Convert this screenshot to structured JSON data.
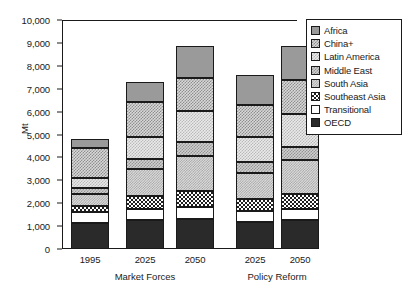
{
  "chart_data": {
    "type": "bar",
    "title": "",
    "subtitle": "",
    "xlabel": "",
    "ylabel": "Mt",
    "ylim": [
      0,
      10000
    ],
    "ytick_labels": [
      "10,000",
      "9,000",
      "8,000",
      "7,000",
      "6,000",
      "5,000",
      "4,000",
      "3,000",
      "2,000",
      "1,000",
      "0"
    ],
    "ytick_values": [
      10000,
      9000,
      8000,
      7000,
      6000,
      5000,
      4000,
      3000,
      2000,
      1000,
      0
    ],
    "grid": false,
    "stacked": true,
    "legend_position": "right",
    "categories": [
      "1995",
      "2025",
      "2050",
      "2025",
      "2050"
    ],
    "groups": [
      {
        "label": "Market Forces",
        "categories": [
          "1995",
          "2025",
          "2050"
        ]
      },
      {
        "label": "Policy Reform",
        "categories": [
          "2025",
          "2050"
        ]
      }
    ],
    "series": [
      {
        "name": "OECD",
        "color": "#2a2a2a",
        "values": [
          1150,
          1250,
          1300,
          1200,
          1250
        ]
      },
      {
        "name": "Transitional",
        "color": "#ffffff",
        "values": [
          450,
          500,
          520,
          480,
          500
        ]
      },
      {
        "name": "Southeast Asia",
        "color": "#ffffff",
        "values": [
          300,
          550,
          700,
          500,
          650
        ]
      },
      {
        "name": "South Asia",
        "color": "#dcdcdc",
        "values": [
          500,
          1200,
          1550,
          1150,
          1500
        ]
      },
      {
        "name": "Middle East",
        "color": "#cfcfcf",
        "values": [
          250,
          450,
          600,
          450,
          550
        ]
      },
      {
        "name": "Latin America",
        "color": "#eaeaea",
        "values": [
          450,
          950,
          1350,
          1100,
          1450
        ]
      },
      {
        "name": "China+",
        "color": "#d8d8d8",
        "values": [
          1300,
          1500,
          1450,
          1400,
          1500
        ]
      },
      {
        "name": "Africa",
        "color": "#9a9a9a",
        "values": [
          400,
          900,
          1380,
          1320,
          1450
        ]
      }
    ],
    "totals": [
      4800,
      7300,
      8850,
      7600,
      8900
    ]
  },
  "legend": {
    "entries": [
      {
        "label": "Africa",
        "swatch": "africa-swatch"
      },
      {
        "label": "China+",
        "swatch": "china-swatch"
      },
      {
        "label": "Latin America",
        "swatch": "latin-america-swatch"
      },
      {
        "label": "Middle East",
        "swatch": "middle-east-swatch"
      },
      {
        "label": "South Asia",
        "swatch": "south-asia-swatch"
      },
      {
        "label": "Southeast Asia",
        "swatch": "southeast-asia-swatch"
      },
      {
        "label": "Transitional",
        "swatch": "transitional-swatch"
      },
      {
        "label": "OECD",
        "swatch": "oecd-swatch"
      }
    ]
  }
}
